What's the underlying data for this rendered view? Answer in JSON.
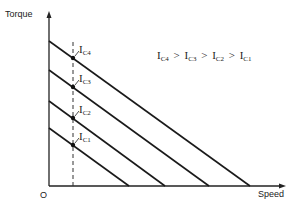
{
  "chart_data": {
    "type": "line",
    "title": "",
    "xlabel": "Speed",
    "ylabel": "Torque",
    "origin_label": "O",
    "relation": "I_C4 > I_C3 > I_C2 > I_C1",
    "series": [
      {
        "name": "IC4",
        "sub": "C4",
        "start": [
          49,
          41
        ],
        "end": [
          250,
          186
        ],
        "marker": [
          73,
          58
        ]
      },
      {
        "name": "IC3",
        "sub": "C3",
        "start": [
          49,
          70
        ],
        "end": [
          209,
          186
        ],
        "marker": [
          73,
          87
        ]
      },
      {
        "name": "IC2",
        "sub": "C2",
        "start": [
          49,
          101
        ],
        "end": [
          165,
          186
        ],
        "marker": [
          73,
          118
        ]
      },
      {
        "name": "IC1",
        "sub": "C1",
        "start": [
          49,
          128
        ],
        "end": [
          129,
          186
        ],
        "marker": [
          73,
          145
        ]
      }
    ],
    "reference_line": {
      "type": "vertical-dashed",
      "x": 73
    }
  },
  "labels": {
    "torque": "Torque",
    "speed": "Speed",
    "origin": "O",
    "I": "I",
    "gt": ">",
    "rel": [
      {
        "I": "I",
        "sub": "C4"
      },
      {
        "I": "I",
        "sub": "C3"
      },
      {
        "I": "I",
        "sub": "C2"
      },
      {
        "I": "I",
        "sub": "C1"
      }
    ]
  }
}
